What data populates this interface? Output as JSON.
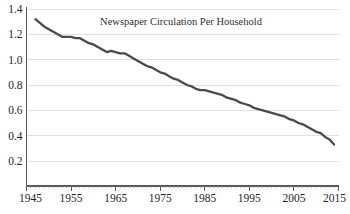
{
  "chart_data": {
    "type": "line",
    "title": "Newspaper Circulation Per Household",
    "xlabel": "",
    "ylabel": "",
    "xlim": [
      1945,
      2015
    ],
    "ylim": [
      0.0,
      1.45
    ],
    "grid": true,
    "grid_axis": "y",
    "legend": "none",
    "line_color": "#4a4a4a",
    "grid_color": "#d8d8d8",
    "axis_color": "#5a5a5a",
    "background_color": "#ffffff",
    "y_ticks": [
      0.2,
      0.4,
      0.6,
      0.8,
      1.0,
      1.2,
      1.4
    ],
    "y_tick_labels": [
      "0.2",
      "0.4",
      "0.6",
      "0.8",
      "1.0",
      "1.2",
      "1.4"
    ],
    "x_ticks": [
      1945,
      1955,
      1965,
      1975,
      1985,
      1995,
      2005,
      2015
    ],
    "x_tick_labels": [
      "1945",
      "1955",
      "1965",
      "1975",
      "1985",
      "1995",
      "2005",
      "2015"
    ],
    "x_minor_tick_interval": 1,
    "series": [
      {
        "name": "Newspaper Circulation Per Household",
        "color": "#4a4a4a",
        "x": [
          1947,
          1948,
          1949,
          1950,
          1951,
          1952,
          1953,
          1954,
          1955,
          1956,
          1957,
          1958,
          1959,
          1960,
          1961,
          1962,
          1963,
          1964,
          1965,
          1966,
          1967,
          1968,
          1969,
          1970,
          1971,
          1972,
          1973,
          1974,
          1975,
          1976,
          1977,
          1978,
          1979,
          1980,
          1981,
          1982,
          1983,
          1984,
          1985,
          1986,
          1987,
          1988,
          1989,
          1990,
          1991,
          1992,
          1993,
          1994,
          1995,
          1996,
          1997,
          1998,
          1999,
          2000,
          2001,
          2002,
          2003,
          2004,
          2005,
          2006,
          2007,
          2008,
          2009,
          2010,
          2011,
          2012,
          2013,
          2014
        ],
        "y": [
          1.32,
          1.29,
          1.26,
          1.24,
          1.22,
          1.2,
          1.18,
          1.18,
          1.18,
          1.17,
          1.17,
          1.15,
          1.13,
          1.12,
          1.1,
          1.08,
          1.06,
          1.07,
          1.06,
          1.05,
          1.05,
          1.03,
          1.01,
          0.99,
          0.97,
          0.95,
          0.94,
          0.92,
          0.9,
          0.89,
          0.87,
          0.85,
          0.84,
          0.82,
          0.8,
          0.79,
          0.77,
          0.76,
          0.76,
          0.75,
          0.74,
          0.73,
          0.72,
          0.7,
          0.69,
          0.68,
          0.66,
          0.65,
          0.64,
          0.62,
          0.61,
          0.6,
          0.59,
          0.58,
          0.57,
          0.56,
          0.55,
          0.53,
          0.52,
          0.5,
          0.49,
          0.47,
          0.45,
          0.43,
          0.42,
          0.39,
          0.37,
          0.33
        ]
      }
    ]
  }
}
